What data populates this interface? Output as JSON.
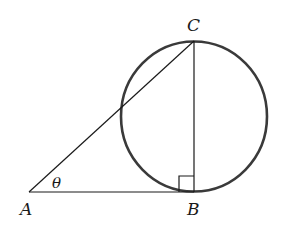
{
  "diagram": {
    "type": "geometry",
    "points": {
      "A": {
        "label": "A",
        "x": 29,
        "y": 192
      },
      "B": {
        "label": "B",
        "x": 194,
        "y": 192
      },
      "C": {
        "label": "C",
        "x": 194,
        "y": 41
      }
    },
    "circle": {
      "cx": 194,
      "cy": 116.5,
      "r": 74
    },
    "angle_label": "θ",
    "right_angle_marker": "B",
    "colors": {
      "circle_stroke": "#3a3a3a",
      "line_stroke": "#1a1a1a",
      "background": "#ffffff"
    }
  },
  "labels": {
    "A": "A",
    "B": "B",
    "C": "C",
    "theta": "θ"
  }
}
